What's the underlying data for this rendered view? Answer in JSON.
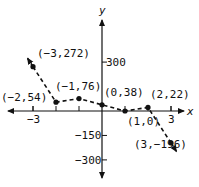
{
  "chart_data": {
    "type": "line",
    "title": "",
    "xlabel": "x",
    "ylabel": "y",
    "x": [
      -3,
      -2,
      -1,
      0,
      1,
      2,
      3
    ],
    "series": [
      {
        "name": "f(x)",
        "values": [
          272,
          54,
          76,
          38,
          0,
          22,
          -196
        ],
        "style": "dashed",
        "arrows_at_ends": true
      }
    ],
    "point_labels": [
      "(-3,272)",
      "(-2,54)",
      "(-1,76)",
      "(0,38)",
      "(1,0)",
      "(2,22)",
      "(3,-196)"
    ],
    "x_ticks": [
      {
        "value": -3,
        "label": "-3"
      },
      {
        "value": 3,
        "label": "3"
      }
    ],
    "y_ticks": [
      {
        "value": 300,
        "label": "300"
      },
      {
        "value": -150,
        "label": "-150"
      },
      {
        "value": -300,
        "label": "-300"
      }
    ],
    "grid": false
  },
  "axes": {
    "x_label": "x",
    "y_label": "y"
  }
}
